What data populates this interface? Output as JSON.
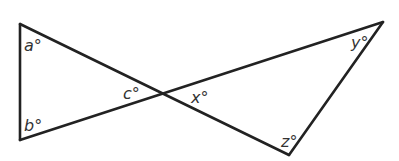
{
  "diagram": {
    "stroke_color": "#222222",
    "vertices": {
      "top_left": [
        20,
        24
      ],
      "bottom_left": [
        20,
        140
      ],
      "crossing": [
        162,
        94
      ],
      "top_right": [
        383,
        22
      ],
      "bottom_right": [
        289,
        155
      ]
    },
    "labels": {
      "a": "a°",
      "b": "b°",
      "c": "c°",
      "x": "x°",
      "y": "y°",
      "z": "z°"
    }
  }
}
